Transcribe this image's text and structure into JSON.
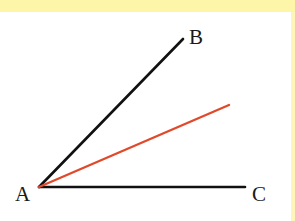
{
  "diagram": {
    "type": "angle",
    "colors": {
      "background": "#ffffff",
      "border": "#fdf6a8",
      "ray": "#111111",
      "inner_ray": "#e04a2a",
      "label": "#1a1a1a"
    },
    "points": {
      "A": {
        "label": "A",
        "x": 39,
        "y": 187
      },
      "B": {
        "label": "B",
        "x": 183,
        "y": 39
      },
      "C": {
        "label": "C",
        "x": 245,
        "y": 187
      },
      "D": {
        "label": "",
        "x": 229,
        "y": 105
      }
    },
    "segments": [
      {
        "from": "A",
        "to": "B",
        "color": "#111111"
      },
      {
        "from": "A",
        "to": "C",
        "color": "#111111"
      },
      {
        "from": "A",
        "to": "D",
        "color": "#e04a2a"
      }
    ],
    "labels": {
      "A": "A",
      "B": "B",
      "C": "C"
    }
  }
}
